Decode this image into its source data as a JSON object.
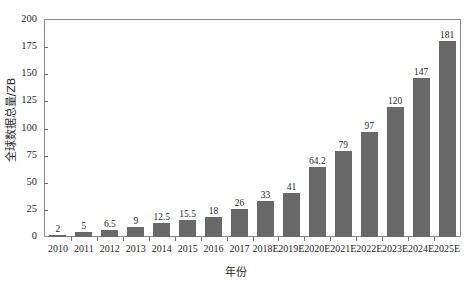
{
  "chart_data": {
    "type": "bar",
    "title": "",
    "subtitle": "",
    "xlabel": "年份",
    "ylabel": "全球数据总量/ZB",
    "categories": [
      "2010",
      "2011",
      "2012",
      "2013",
      "2014",
      "2015",
      "2016",
      "2017",
      "2018E",
      "2019E",
      "2020E",
      "2021E",
      "2022E",
      "2023E",
      "2024E",
      "2025E"
    ],
    "values": [
      2,
      5,
      6.5,
      9,
      12.5,
      15.5,
      18,
      26,
      33,
      41,
      64.2,
      79,
      97,
      120,
      147,
      181
    ],
    "value_labels": [
      "2",
      "5",
      "6.5",
      "9",
      "12.5",
      "15.5",
      "18",
      "26",
      "33",
      "41",
      "64.2",
      "79",
      "97",
      "120",
      "147",
      "181"
    ],
    "ylim": [
      0,
      200
    ],
    "yticks": [
      0,
      25,
      50,
      75,
      100,
      125,
      150,
      175,
      200
    ],
    "ytick_labels": [
      "0",
      "25",
      "50",
      "75",
      "100",
      "125",
      "150",
      "175",
      "200"
    ],
    "grid": false,
    "legend": false,
    "legend_position": "none",
    "series": [
      {
        "name": "全球数据总量",
        "color": "#696969",
        "values": [
          2,
          5,
          6.5,
          9,
          12.5,
          15.5,
          18,
          26,
          33,
          41,
          64.2,
          79,
          97,
          120,
          147,
          181
        ]
      }
    ],
    "bar_color": "#696969",
    "frame_color": "#8a8a8a",
    "background_color": "#ffffff",
    "text_color": "#1f1f1f"
  }
}
